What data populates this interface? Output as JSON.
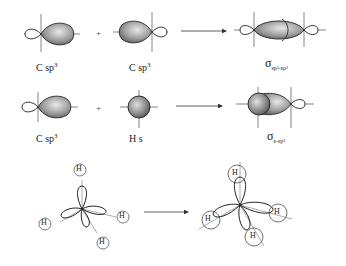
{
  "diagram": {
    "row1": {
      "left_label": "C sp",
      "left_sup": "3",
      "middle_label": "C sp",
      "middle_sup": "3",
      "operator": "+",
      "result_symbol": "σ",
      "result_sub": "sp³-sp³"
    },
    "row2": {
      "left_label": "C sp",
      "left_sup": "3",
      "middle_label": "H s",
      "operator": "+",
      "result_symbol": "σ",
      "result_sub": "s-sp³"
    },
    "row3": {
      "atom_labels": [
        "H",
        "H",
        "H",
        "H"
      ],
      "result_atom_labels": [
        "H",
        "H",
        "H",
        "H"
      ]
    },
    "colors": {
      "lobe_dark": "#555555",
      "lobe_light": "#d8d8d8",
      "line": "#333333"
    }
  }
}
